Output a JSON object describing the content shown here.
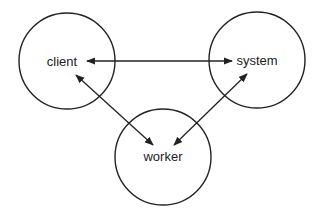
{
  "diagram": {
    "nodes": [
      {
        "id": "client",
        "label": "client",
        "cx": 67,
        "cy": 61,
        "r": 48
      },
      {
        "id": "system",
        "label": "system",
        "cx": 257,
        "cy": 60,
        "r": 48
      },
      {
        "id": "worker",
        "label": "worker",
        "cx": 163,
        "cy": 157,
        "r": 48
      }
    ],
    "edges": [
      {
        "from": "client",
        "to": "system",
        "bidirectional": true
      },
      {
        "from": "client",
        "to": "worker",
        "bidirectional": true
      },
      {
        "from": "system",
        "to": "worker",
        "bidirectional": true
      }
    ],
    "colors": {
      "stroke": "#222222",
      "background": "#ffffff"
    }
  }
}
